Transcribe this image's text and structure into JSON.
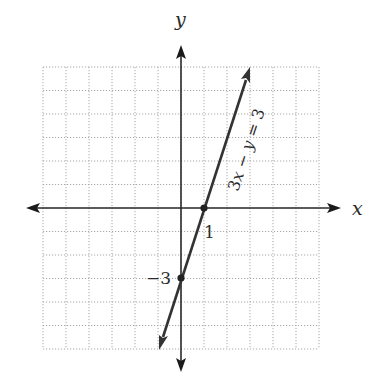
{
  "chart_data": {
    "type": "line",
    "title": "",
    "xlabel": "x",
    "ylabel": "y",
    "xlim": [
      -6,
      6
    ],
    "ylim": [
      -6,
      6
    ],
    "grid": true,
    "grid_style": "dotted",
    "grid_step": 1,
    "series": [
      {
        "name": "3x − y = 3",
        "equation": "3x - y = 3",
        "slope": 3,
        "intercept": -3,
        "x": [
          -1,
          0,
          1,
          3
        ],
        "y": [
          -6,
          -3,
          0,
          6
        ],
        "arrows": "both",
        "color": "#333333"
      }
    ],
    "points": [
      {
        "x": 1,
        "y": 0,
        "label": "1",
        "description": "x-intercept"
      },
      {
        "x": 0,
        "y": -3,
        "label": "−3",
        "description": "y-intercept"
      }
    ],
    "annotations": [
      {
        "text": "3x − y = 3",
        "position": "along line, upper right",
        "rotation": "parallel to line"
      }
    ]
  },
  "labels": {
    "x_axis": "x",
    "y_axis": "y",
    "x_intercept": "1",
    "y_intercept": "−3",
    "equation_prefix": "3",
    "equation_x": "x",
    "equation_minus": " − ",
    "equation_y": "y",
    "equation_suffix": " = 3"
  },
  "colors": {
    "grid": "#a8a8a8",
    "axis": "#2a2a2a",
    "line": "#333333",
    "background": "#ffffff"
  }
}
